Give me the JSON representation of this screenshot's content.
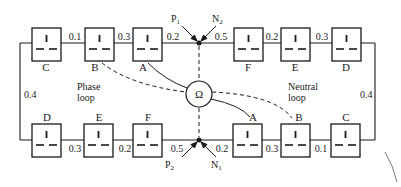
{
  "diagram": {
    "meter": {
      "symbol": "Ω"
    },
    "loops": {
      "phase_label": [
        "Phase",
        "loop"
      ],
      "neutral_label": [
        "Neutral",
        "loop"
      ]
    },
    "terminals": {
      "p1": {
        "letter": "P",
        "sub": "1"
      },
      "n2": {
        "letter": "N",
        "sub": "2"
      },
      "p2": {
        "letter": "P",
        "sub": "2"
      },
      "n1": {
        "letter": "N",
        "sub": "1"
      }
    },
    "top_row": {
      "sockets": [
        "C",
        "B",
        "A",
        "F",
        "E",
        "D"
      ],
      "resistances": [
        "0.1",
        "0.3",
        "0.2",
        "0.5",
        "0.2",
        "0.3"
      ]
    },
    "bottom_row": {
      "sockets": [
        "D",
        "E",
        "F",
        "A",
        "B",
        "C"
      ],
      "resistances": [
        "0.3",
        "0.2",
        "0.5",
        "0.2",
        "0.3",
        "0.1"
      ]
    },
    "side_resistances": {
      "left": "0.4",
      "right": "0.4"
    }
  }
}
